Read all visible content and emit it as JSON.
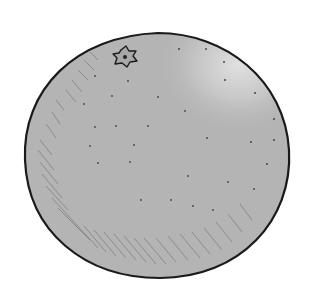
{
  "image": {
    "subject": "orange",
    "alt": "Grayscale hand-drawn illustration of a round citrus fruit (orange) with a star-shaped stem scar",
    "colors": {
      "background": "#ffffff",
      "fruit_fill": "#b4b4b4",
      "highlight": "#dcdcdc",
      "outline": "#1a1a1a",
      "hatch": "#6e6e6e",
      "pore": "#4a4a4a"
    },
    "elements": {
      "stem_scar": "star-shaped calyx mark, upper left",
      "pores": "scattered dots across surface",
      "shading": "diagonal hatching along lower-left edge"
    }
  }
}
